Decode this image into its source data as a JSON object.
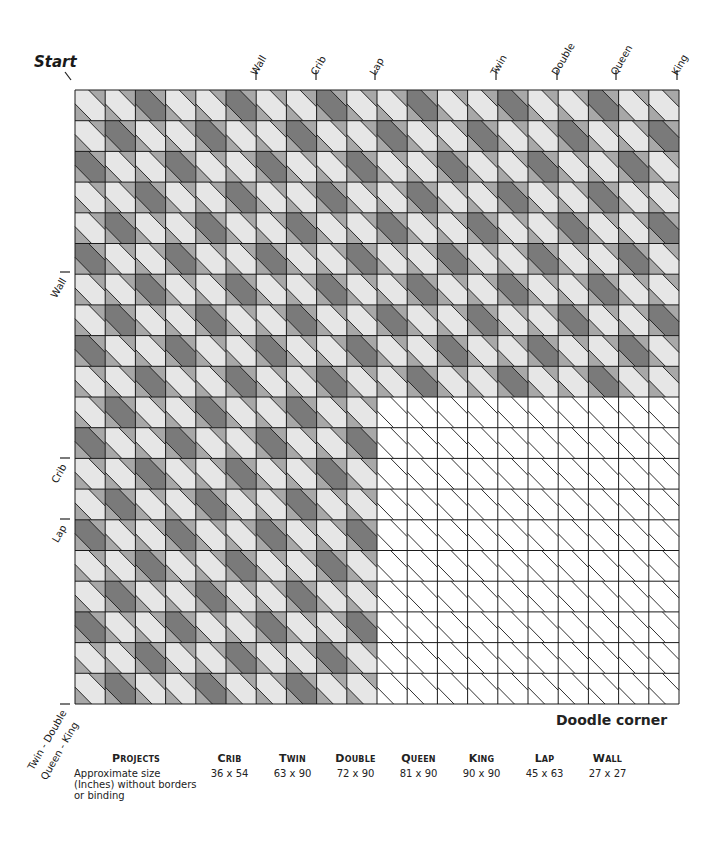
{
  "diagram": {
    "start_label": "Start",
    "corner_label": "Doodle corner",
    "grid": {
      "columns": 20,
      "rows": 20,
      "origin_x": 75,
      "origin_y": 90,
      "cell_width": 30.2,
      "cell_height": 30.7,
      "shaded_region": "rows 0-9 all columns; rows 10-19 columns 0-9",
      "dark_rule": "(row + col) mod 3 == 2",
      "colors": {
        "light": "#e6e6e6",
        "dark": "#7a7a7a",
        "corner": "#a8a8a8",
        "blank": "#ffffff",
        "line": "#1a1a1a"
      }
    },
    "top_markers": [
      {
        "label": "Wall",
        "x": 256
      },
      {
        "label": "Crib",
        "x": 316
      },
      {
        "label": "Lap",
        "x": 375
      },
      {
        "label": "Twin",
        "x": 496
      },
      {
        "label": "Double",
        "x": 557
      },
      {
        "label": "Queen",
        "x": 616
      },
      {
        "label": "King",
        "x": 677
      }
    ],
    "left_markers": [
      {
        "label": "Wall",
        "y": 272
      },
      {
        "label": "Crib",
        "y": 458
      },
      {
        "label": "Lap",
        "y": 519
      },
      {
        "label": "Twin - Double",
        "y": 704
      },
      {
        "label": "Queen - King",
        "y": 704
      }
    ]
  },
  "projects_table": {
    "header_label": "Projects",
    "row_label": "Approximate size (Inches) without borders or binding",
    "columns": [
      {
        "name": "Crib",
        "size": "36 x 54"
      },
      {
        "name": "Twin",
        "size": "63 x 90"
      },
      {
        "name": "Double",
        "size": "72 x 90"
      },
      {
        "name": "Queen",
        "size": "81 x 90"
      },
      {
        "name": "King",
        "size": "90 x 90"
      },
      {
        "name": "Lap",
        "size": "45 x 63"
      },
      {
        "name": "Wall",
        "size": "27 x 27"
      }
    ]
  }
}
